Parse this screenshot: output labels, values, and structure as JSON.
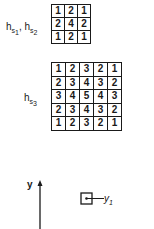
{
  "kernels": {
    "s1s2": {
      "label": "h",
      "label_sub_a": "s",
      "label_sub_a_idx": "1",
      "sep": ", ",
      "label_b": "h",
      "label_sub_b": "s",
      "label_sub_b_idx": "2",
      "rows": [
        [
          "1",
          "2",
          "1"
        ],
        [
          "2",
          "4",
          "2"
        ],
        [
          "1",
          "2",
          "1"
        ]
      ]
    },
    "s3": {
      "label": "h",
      "label_sub": "s",
      "label_sub_idx": "3",
      "rows": [
        [
          "1",
          "2",
          "3",
          "2",
          "1"
        ],
        [
          "2",
          "3",
          "4",
          "3",
          "2"
        ],
        [
          "3",
          "4",
          "5",
          "4",
          "3"
        ],
        [
          "2",
          "3",
          "4",
          "3",
          "2"
        ],
        [
          "1",
          "2",
          "3",
          "2",
          "1"
        ]
      ]
    }
  },
  "axis": {
    "label": "y"
  },
  "unit": {
    "label": "y",
    "sub": "1"
  },
  "colors": {
    "ink": "#1a1a1a",
    "background": "#ffffff"
  }
}
